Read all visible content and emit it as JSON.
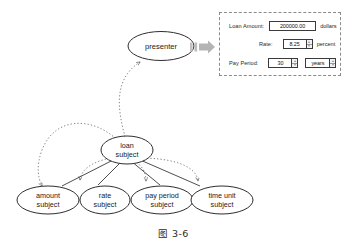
{
  "figure": {
    "caption": "图 3-6"
  },
  "diagram": {
    "presenter_node": {
      "label": "presenter"
    },
    "subject_node": {
      "line1": "loan",
      "line2": "subject"
    },
    "child_nodes": [
      {
        "line1": "amount",
        "line2": "subject"
      },
      {
        "line1": "rate",
        "line2": "subject"
      },
      {
        "line1": "pay period",
        "line2": "subject"
      },
      {
        "line1": "time unit",
        "line2": "subject"
      }
    ],
    "arrow_icon": "thick-right-arrow-icon"
  },
  "form": {
    "rows": [
      {
        "label": "Loan Amount:",
        "value": "200000.00",
        "unit": "dollars",
        "has_spinner": false
      },
      {
        "label": "Rate:",
        "value": "8.25",
        "unit": "percent",
        "has_spinner": true
      },
      {
        "label": "Pay Period:",
        "value": "30",
        "unit": "",
        "has_spinner": true,
        "select_value": "years"
      }
    ]
  },
  "colors": {
    "stroke": "#3a3a3a",
    "dashed": "#8a8a8a",
    "arrow_gray": "#b9b9b9",
    "text": "#1a1a1a"
  }
}
